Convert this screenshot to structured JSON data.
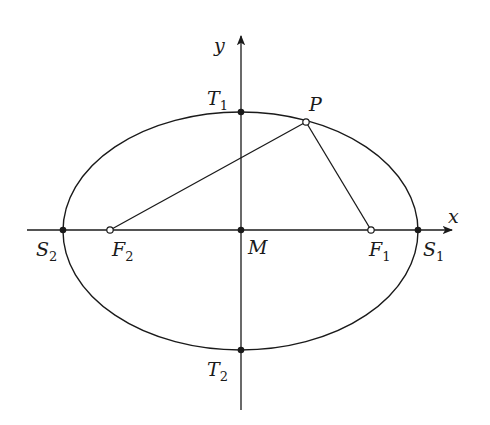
{
  "diagram": {
    "type": "ellipse-foci",
    "colors": {
      "stroke": "#1a1a1a",
      "background": "#ffffff"
    },
    "axes": {
      "x_label": "x",
      "y_label": "y"
    },
    "center": {
      "label": "M",
      "x": 241,
      "y": 230
    },
    "ellipse": {
      "cx": 240.5,
      "cy": 231,
      "rx": 177.5,
      "ry": 119
    },
    "points": {
      "T1": {
        "base": "T",
        "sub": "1",
        "x": 241,
        "y": 112,
        "style": "filled"
      },
      "T2": {
        "base": "T",
        "sub": "2",
        "x": 241,
        "y": 350,
        "style": "filled"
      },
      "S1": {
        "base": "S",
        "sub": "1",
        "x": 418,
        "y": 230,
        "style": "filled"
      },
      "S2": {
        "base": "S",
        "sub": "2",
        "x": 63,
        "y": 230,
        "style": "filled"
      },
      "F1": {
        "base": "F",
        "sub": "1",
        "x": 371,
        "y": 230,
        "style": "hollow"
      },
      "F2": {
        "base": "F",
        "sub": "2",
        "x": 110,
        "y": 230,
        "style": "hollow"
      },
      "P": {
        "base": "P",
        "sub": "",
        "x": 306,
        "y": 122,
        "style": "hollow"
      },
      "M": {
        "base": "M",
        "sub": "",
        "x": 241,
        "y": 230,
        "style": "filled"
      }
    },
    "segments": [
      {
        "from": "F2",
        "to": "P"
      },
      {
        "from": "P",
        "to": "F1"
      }
    ]
  }
}
